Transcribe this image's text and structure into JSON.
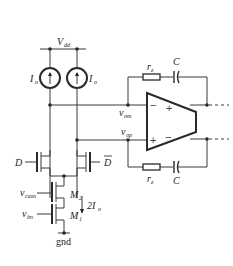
{
  "diagram": {
    "type": "circuit-schematic",
    "supply": {
      "label": "V",
      "sub": "dd"
    },
    "ground": {
      "label": "gnd"
    },
    "current_sources": [
      {
        "label": "I",
        "sub": "o"
      },
      {
        "label": "I",
        "sub": "o"
      }
    ],
    "switch_inputs": {
      "left": "D",
      "right": "D"
    },
    "transistors": [
      {
        "label": "M",
        "sub": "2",
        "gate": {
          "label": "v",
          "sub": "casn"
        }
      },
      {
        "label": "M",
        "sub": "1",
        "gate": {
          "label": "v",
          "sub": "bn"
        }
      }
    ],
    "tail_current": {
      "label": "2I",
      "sub": "o"
    },
    "nodes": {
      "top": {
        "label": "v",
        "sub": "om"
      },
      "bottom": {
        "label": "v",
        "sub": "op"
      }
    },
    "opamp": {
      "top_in": "−",
      "top_out": "+",
      "bottom_in": "+",
      "bottom_out": "−"
    },
    "feedback_top": {
      "resistor": {
        "label": "r",
        "sub": "z"
      },
      "capacitor": {
        "label": "C"
      }
    },
    "feedback_bottom": {
      "resistor": {
        "label": "r",
        "sub": "z"
      },
      "capacitor": {
        "label": "C"
      }
    }
  }
}
